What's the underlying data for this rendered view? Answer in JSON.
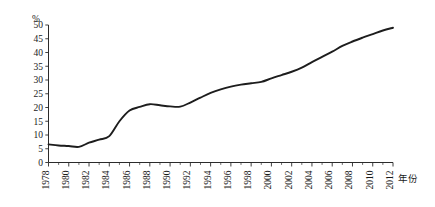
{
  "chart_data": {
    "type": "line",
    "title": "",
    "xlabel": "年份",
    "ylabel": "%",
    "ylim": [
      0,
      50
    ],
    "xlim": [
      1978,
      2012
    ],
    "grid": false,
    "legend": false,
    "y_ticks": [
      "0",
      "5",
      "10",
      "15",
      "20",
      "25",
      "30",
      "35",
      "40",
      "45",
      "50"
    ],
    "y_tick_values": [
      0,
      5,
      10,
      15,
      20,
      25,
      30,
      35,
      40,
      45,
      50
    ],
    "x_ticks": [
      "1978",
      "1980",
      "1982",
      "1984",
      "1986",
      "1988",
      "1990",
      "1992",
      "1994",
      "1996",
      "1998",
      "2000",
      "2002",
      "2004",
      "2006",
      "2008",
      "2010",
      "2012"
    ],
    "x_tick_values": [
      1978,
      1980,
      1982,
      1984,
      1986,
      1988,
      1990,
      1992,
      1994,
      1996,
      1998,
      2000,
      2002,
      2004,
      2006,
      2008,
      2010,
      2012
    ],
    "x": [
      1978,
      1979,
      1980,
      1981,
      1982,
      1983,
      1984,
      1985,
      1986,
      1987,
      1988,
      1989,
      1990,
      1991,
      1992,
      1993,
      1994,
      1995,
      1996,
      1997,
      1998,
      1999,
      2000,
      2001,
      2002,
      2003,
      2004,
      2005,
      2006,
      2007,
      2008,
      2009,
      2010,
      2011,
      2012
    ],
    "values": [
      6.6,
      6.2,
      6.0,
      5.7,
      7.2,
      8.3,
      9.6,
      15.0,
      18.9,
      20.2,
      21.2,
      20.8,
      20.4,
      20.3,
      21.8,
      23.6,
      25.3,
      26.6,
      27.6,
      28.3,
      28.8,
      29.3,
      30.6,
      31.8,
      33.0,
      34.5,
      36.5,
      38.4,
      40.3,
      42.4,
      44.0,
      45.4,
      46.7,
      48.0,
      49.0
    ],
    "series_name": "城镇化率"
  }
}
